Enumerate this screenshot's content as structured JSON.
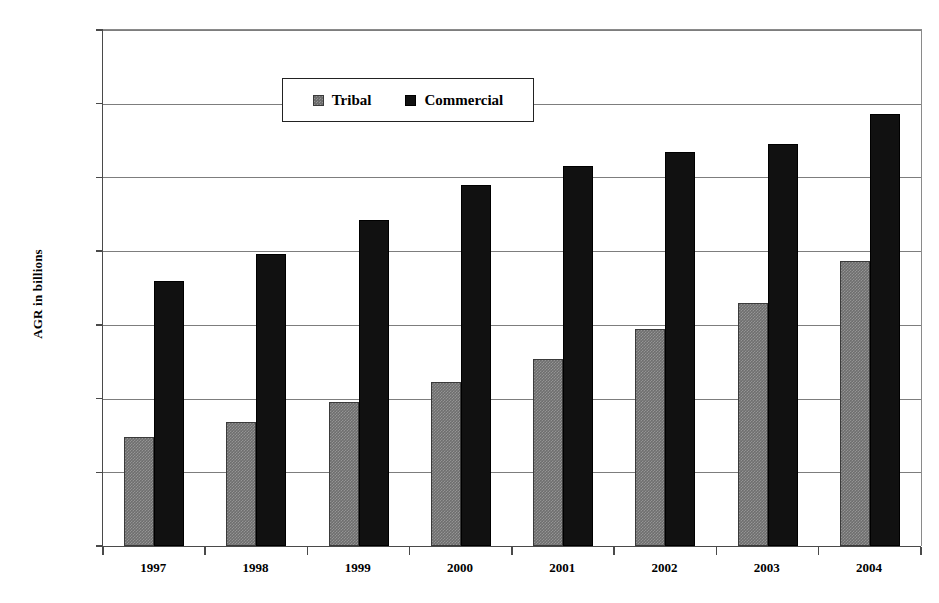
{
  "chart_data": {
    "type": "bar",
    "title": "",
    "subtitle": "",
    "xlabel": "",
    "ylabel": "AGR in billions",
    "categories": [
      "1997",
      "1998",
      "1999",
      "2000",
      "2001",
      "2002",
      "2003",
      "2004"
    ],
    "series": [
      {
        "name": "Tribal",
        "color": "#6e6e6e",
        "values": [
          7.4,
          8.4,
          9.8,
          11.1,
          12.7,
          14.7,
          16.5,
          19.3
        ]
      },
      {
        "name": "Commercial",
        "color": "#111111",
        "values": [
          18.0,
          19.8,
          22.1,
          24.5,
          25.8,
          26.7,
          27.3,
          29.3
        ]
      }
    ],
    "ylim": [
      0,
      35
    ],
    "ytick_values": [
      0,
      5,
      10,
      15,
      20,
      25,
      30,
      35
    ],
    "ytick_labels": [
      "$0.0",
      "$5.0",
      "$10.0",
      "$15.0",
      "$20.0",
      "$25.0",
      "$30.0",
      "$35.0"
    ],
    "grid": true,
    "grid_axis": "y",
    "legend_position": "top-center",
    "legend_entries": [
      "Tribal",
      "Commercial"
    ],
    "annotations": []
  }
}
